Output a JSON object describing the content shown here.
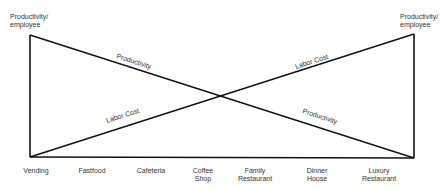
{
  "diagram": {
    "left_axis_title": "Productivity/\nemployee",
    "right_axis_title": "Productivity/\nemployee",
    "line_labels": {
      "productivity_upper": "Productivity",
      "productivity_lower": "Productivity",
      "labor_cost_lower": "Labor Cost",
      "labor_cost_upper": "Labor Cost"
    },
    "categories": [
      "Vending",
      "Fastfood",
      "Cafeteria",
      "Coffee\nShop",
      "Family\nRestaurant",
      "Dinner\nHouse",
      "Luxury\nRestaurant"
    ],
    "colors": {
      "line": "#111111",
      "text": "#333333",
      "background": "#ffffff"
    }
  }
}
